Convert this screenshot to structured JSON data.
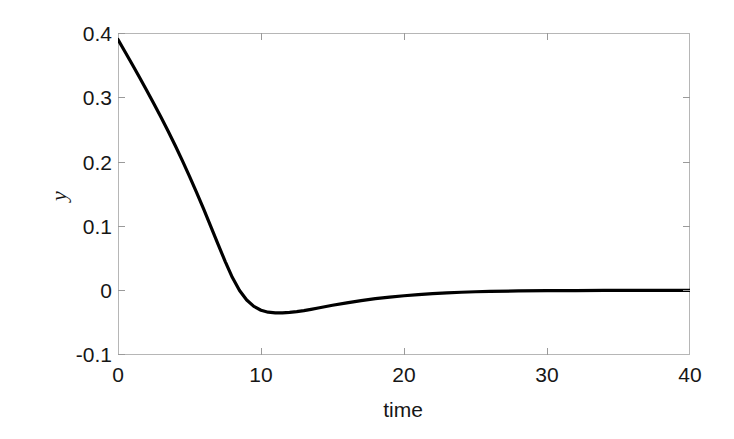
{
  "chart_data": {
    "type": "line",
    "title": "",
    "xlabel": "time",
    "ylabel": "y",
    "xlim": [
      0,
      40
    ],
    "ylim": [
      -0.1,
      0.4
    ],
    "grid": false,
    "legend": null,
    "xticks": [
      "0",
      "10",
      "20",
      "30",
      "40"
    ],
    "xtick_values": [
      0,
      10,
      20,
      30,
      40
    ],
    "yticks": [
      "0.4",
      "0.3",
      "0.2",
      "0.1",
      "0",
      "-0.1"
    ],
    "ytick_values": [
      0.4,
      0.3,
      0.2,
      0.1,
      0,
      -0.1
    ],
    "series": [
      {
        "name": "y(t)",
        "color": "#000000",
        "linewidth": 3,
        "x": [
          0,
          0.5,
          1,
          1.5,
          2,
          2.5,
          3,
          3.5,
          4,
          4.5,
          5,
          5.5,
          6,
          6.5,
          7,
          7.5,
          8,
          8.5,
          9,
          9.5,
          10,
          10.5,
          11,
          11.5,
          12,
          12.5,
          13,
          13.5,
          14,
          15,
          16,
          17,
          18,
          19,
          20,
          21,
          22,
          23,
          24,
          25,
          26,
          28,
          30,
          32,
          34,
          36,
          38,
          40
        ],
        "y": [
          0.39,
          0.3705,
          0.351,
          0.3312,
          0.311,
          0.2905,
          0.2695,
          0.2478,
          0.2252,
          0.2018,
          0.1775,
          0.1522,
          0.126,
          0.099,
          0.0718,
          0.045,
          0.0202,
          0.0002,
          -0.0145,
          -0.0245,
          -0.0305,
          -0.0335,
          -0.0345,
          -0.0345,
          -0.0338,
          -0.0326,
          -0.031,
          -0.0291,
          -0.027,
          -0.0228,
          -0.019,
          -0.0156,
          -0.0126,
          -0.0101,
          -0.008,
          -0.0063,
          -0.0048,
          -0.0036,
          -0.0026,
          -0.0018,
          -0.0012,
          -0.0005,
          -0.0001,
          0.0001,
          0.0002,
          0.0002,
          0.0002,
          0.0002
        ],
        "annotations": {
          "start_value": 0.39,
          "minimum_value": -0.062,
          "minimum_time": 9.5,
          "zero_crossing_time": 6.0,
          "settling_value": 0.002
        }
      }
    ]
  },
  "axes": {
    "frame_color": "#b6b6b6",
    "tick_color": "#9a9a9a",
    "background": "#ffffff"
  }
}
